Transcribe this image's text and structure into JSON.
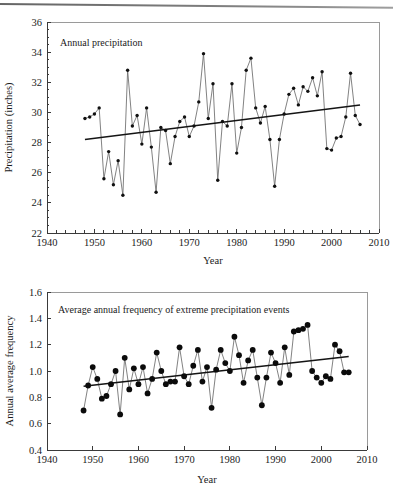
{
  "page": {
    "background_color": "#ffffff",
    "ink_color": "#1a1a1a",
    "scan_artifact": "top-edge-scan-line"
  },
  "figures": [
    {
      "id": "annual-precipitation",
      "panel_label": "Annual precipitation"
    },
    {
      "id": "extreme-precip-frequency",
      "panel_label": "Average annual frequency of extreme precipitation events"
    }
  ],
  "chart_data": [
    {
      "type": "line",
      "id": "annual-precipitation",
      "title": "Annual precipitation",
      "xlabel": "Year",
      "ylabel": "Precipitation (inches)",
      "xlim": [
        1940,
        2010
      ],
      "ylim": [
        22,
        36
      ],
      "xticks": [
        1940,
        1950,
        1960,
        1970,
        1980,
        1990,
        2000,
        2010
      ],
      "xtick_labels": [
        "1940",
        "1950",
        "1960",
        "1970",
        "1980",
        "1990",
        "2000",
        "2010"
      ],
      "yticks": [
        22,
        24,
        26,
        28,
        30,
        32,
        34,
        36
      ],
      "ytick_labels": [
        "22",
        "24",
        "26",
        "28",
        "30",
        "32",
        "34",
        "36"
      ],
      "minor_xticks": true,
      "minor_yticks": true,
      "grid": false,
      "legend": "none",
      "marker": "filled-circle-small",
      "x": [
        1948,
        1949,
        1950,
        1951,
        1952,
        1953,
        1954,
        1955,
        1956,
        1957,
        1958,
        1959,
        1960,
        1961,
        1962,
        1963,
        1964,
        1965,
        1966,
        1967,
        1968,
        1969,
        1970,
        1971,
        1972,
        1973,
        1974,
        1975,
        1976,
        1977,
        1978,
        1979,
        1980,
        1981,
        1982,
        1983,
        1984,
        1985,
        1986,
        1987,
        1988,
        1989,
        1990,
        1991,
        1992,
        1993,
        1994,
        1995,
        1996,
        1997,
        1998,
        1999,
        2000,
        2001,
        2002,
        2003,
        2004,
        2005,
        2006
      ],
      "y": [
        29.6,
        29.7,
        29.9,
        30.3,
        25.6,
        27.4,
        25.2,
        26.8,
        24.5,
        32.8,
        29.1,
        29.8,
        27.9,
        30.3,
        27.7,
        24.7,
        29.0,
        28.8,
        26.6,
        28.4,
        29.4,
        29.7,
        28.4,
        29.1,
        30.7,
        33.9,
        29.6,
        31.9,
        25.5,
        29.4,
        29.1,
        31.9,
        27.3,
        29.0,
        32.8,
        33.6,
        30.3,
        29.3,
        30.4,
        28.2,
        25.1,
        28.2,
        29.9,
        31.2,
        31.6,
        30.5,
        31.7,
        31.4,
        32.3,
        31.1,
        32.7,
        27.6,
        27.5,
        28.3,
        28.4,
        29.7,
        32.6,
        29.8,
        29.2
      ],
      "trend": {
        "x": [
          1948,
          2006
        ],
        "y": [
          28.2,
          30.5
        ],
        "description": "linear trend line, increasing"
      }
    },
    {
      "type": "line",
      "id": "extreme-precip-frequency",
      "title": "Average annual frequency of extreme precipitation events",
      "xlabel": "Year",
      "ylabel": "Annual average frequency",
      "xlim": [
        1940,
        2010
      ],
      "ylim": [
        0.4,
        1.6
      ],
      "xticks": [
        1940,
        1950,
        1960,
        1970,
        1980,
        1990,
        2000,
        2010
      ],
      "xtick_labels": [
        "1940",
        "1950",
        "1960",
        "1970",
        "1980",
        "1990",
        "2000",
        "2010"
      ],
      "yticks": [
        0.4,
        0.6,
        0.8,
        1.0,
        1.2,
        1.4,
        1.6
      ],
      "ytick_labels": [
        "0.4",
        "0.6",
        "0.8",
        "1.0",
        "1.2",
        "1.4",
        "1.6"
      ],
      "minor_xticks": false,
      "minor_yticks": false,
      "grid": false,
      "legend": "none",
      "marker": "filled-circle-large",
      "x": [
        1948,
        1949,
        1950,
        1951,
        1952,
        1953,
        1954,
        1955,
        1956,
        1957,
        1958,
        1959,
        1960,
        1961,
        1962,
        1963,
        1964,
        1965,
        1966,
        1967,
        1968,
        1969,
        1970,
        1971,
        1972,
        1973,
        1974,
        1975,
        1976,
        1977,
        1978,
        1979,
        1980,
        1981,
        1982,
        1983,
        1984,
        1985,
        1986,
        1987,
        1988,
        1989,
        1990,
        1991,
        1992,
        1993,
        1994,
        1995,
        1996,
        1997,
        1998,
        1999,
        2000,
        2001,
        2002,
        2003,
        2004,
        2005,
        2006
      ],
      "y": [
        0.7,
        0.89,
        1.03,
        0.94,
        0.79,
        0.81,
        0.9,
        1.0,
        0.67,
        1.1,
        0.86,
        1.02,
        0.9,
        1.03,
        0.83,
        0.94,
        1.14,
        1.0,
        0.9,
        0.92,
        0.92,
        1.18,
        0.96,
        0.9,
        1.04,
        1.16,
        0.92,
        1.03,
        0.72,
        1.01,
        1.16,
        1.06,
        1.0,
        1.26,
        1.12,
        0.91,
        1.08,
        1.16,
        0.95,
        0.74,
        0.95,
        1.14,
        1.06,
        0.91,
        1.18,
        0.97,
        1.3,
        1.31,
        1.32,
        1.35,
        1.0,
        0.95,
        0.91,
        0.96,
        0.94,
        1.2,
        1.15,
        0.99,
        0.99
      ],
      "trend": {
        "x": [
          1948,
          2006
        ],
        "y": [
          0.885,
          1.11
        ],
        "description": "linear trend line, increasing"
      }
    }
  ]
}
